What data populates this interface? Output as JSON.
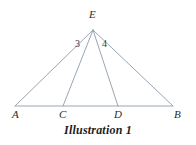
{
  "figure": {
    "caption": "Illustration 1",
    "stroke_color": "#9aa6b4",
    "label_color": "#2b2b2b",
    "background_color": "#ffffff",
    "vertices": [
      {
        "name": "A",
        "label": "A",
        "x": 15,
        "y": 106,
        "label_x": 14,
        "label_y": 110
      },
      {
        "name": "B",
        "label": "B",
        "x": 173,
        "y": 106,
        "label_x": 176,
        "label_y": 110
      },
      {
        "name": "C",
        "label": "C",
        "x": 63,
        "y": 106,
        "label_x": 60,
        "label_y": 110
      },
      {
        "name": "D",
        "label": "D",
        "x": 118,
        "y": 106,
        "label_x": 116,
        "label_y": 110
      },
      {
        "name": "E",
        "label": "E",
        "x": 93,
        "y": 30,
        "label_x": 89,
        "label_y": 10
      }
    ],
    "segments": [
      {
        "name": "segment-AB",
        "from": "A",
        "to": "B"
      },
      {
        "name": "segment-AE",
        "from": "A",
        "to": "E"
      },
      {
        "name": "segment-BE",
        "from": "B",
        "to": "E"
      },
      {
        "name": "segment-CE",
        "from": "C",
        "to": "E"
      },
      {
        "name": "segment-DE",
        "from": "D",
        "to": "E"
      }
    ],
    "angle_labels": [
      {
        "name": "angle-3",
        "label": "3",
        "x": 76,
        "y": 40
      },
      {
        "name": "angle-4",
        "label": "4",
        "x": 103,
        "y": 40
      }
    ]
  }
}
